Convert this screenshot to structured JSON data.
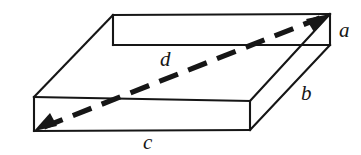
{
  "figure": {
    "kind": "geometry-diagram",
    "background_color": "#ffffff",
    "stroke_color": "#161616",
    "canvas": {
      "width": 361,
      "height": 155
    },
    "labels": {
      "a": {
        "text": "a",
        "role": "height-edge-label",
        "x": 339,
        "y": 20
      },
      "b": {
        "text": "b",
        "role": "depth-edge-label",
        "x": 301,
        "y": 83
      },
      "c": {
        "text": "c",
        "role": "width-edge-label",
        "x": 143,
        "y": 132
      },
      "d": {
        "text": "d",
        "role": "space-diagonal-label",
        "x": 160,
        "y": 49
      }
    },
    "vertices": {
      "top_back_left": [
        113,
        15
      ],
      "top_back_right": [
        330,
        14
      ],
      "top_front_left": [
        34,
        97
      ],
      "top_front_right": [
        250,
        101
      ],
      "bottom_front_left": [
        34,
        131
      ],
      "bottom_front_right": [
        250,
        130
      ],
      "bottom_back_right": [
        330,
        45
      ],
      "bottom_back_left_hidden": [
        113,
        45
      ]
    },
    "edges": [
      {
        "name": "top-back",
        "from": "top_back_left",
        "to": "top_back_right"
      },
      {
        "name": "top-left-slant",
        "from": "top_back_left",
        "to": "top_front_left"
      },
      {
        "name": "top-front",
        "from": "top_front_left",
        "to": "top_front_right"
      },
      {
        "name": "top-right-slant",
        "from": "top_front_right",
        "to": "top_back_right"
      },
      {
        "name": "front-left-vertical",
        "from": "top_front_left",
        "to": "bottom_front_left"
      },
      {
        "name": "front-bottom",
        "from": "bottom_front_left",
        "to": "bottom_front_right"
      },
      {
        "name": "front-right-vertical",
        "from": "top_front_right",
        "to": "bottom_front_right"
      },
      {
        "name": "back-right-vertical",
        "from": "top_back_right",
        "to": "bottom_back_right"
      },
      {
        "name": "bottom-right-slant",
        "from": "bottom_front_right",
        "to": "bottom_back_right"
      },
      {
        "name": "inner-back-horizontal",
        "from": "bottom_back_left_hidden",
        "to": "bottom_back_right"
      },
      {
        "name": "inner-back-vertical",
        "from": "top_back_left",
        "to": "bottom_back_left_hidden"
      }
    ],
    "diagonal": {
      "name": "space-diagonal-d",
      "style": "dashed",
      "double_headed": true,
      "from": [
        34,
        131
      ],
      "to": [
        330,
        14
      ]
    }
  }
}
